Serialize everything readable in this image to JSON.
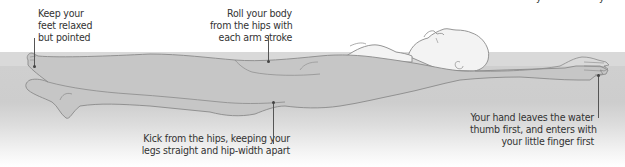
{
  "diagram": {
    "colors": {
      "water": "#d0d0d0",
      "water_surface": "#d9d9d9",
      "body_fill_above": "#f2f2f2",
      "body_fill_below": "#c4c4c4",
      "outline": "#8a8a8a",
      "text": "#333333",
      "leader_line": "#555555"
    },
    "annotations": [
      {
        "id": "feet",
        "text": "Keep your\nfeet relaxed\nbut pointed"
      },
      {
        "id": "roll",
        "text": "Roll your body\nfrom the hips with\neach arm stroke"
      },
      {
        "id": "kick",
        "text": "Kick from the hips, keeping your\nlegs straight and hip-width apart"
      },
      {
        "id": "hand",
        "text": "Your hand leaves the water\nthumb first, and enters with\nyour little finger first"
      }
    ]
  }
}
